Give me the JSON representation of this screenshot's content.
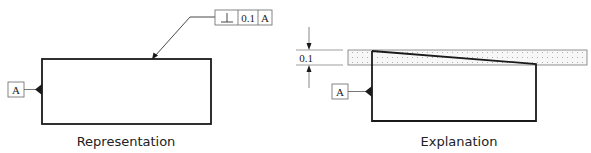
{
  "representation": {
    "caption": "Representation",
    "feature_control_frame": {
      "symbol": "perpendicularity",
      "symbol_glyph": "⊥",
      "tolerance": "0.1",
      "datum": "A"
    },
    "datum_label": "A"
  },
  "explanation": {
    "caption": "Explanation",
    "tolerance_zone_dimension": "0.1",
    "datum_label": "A"
  },
  "colors": {
    "line": "#1a1a1a",
    "frame": "#555555",
    "zone_fill": "#f7f7f7",
    "zone_dots": "#9a9a9a"
  }
}
